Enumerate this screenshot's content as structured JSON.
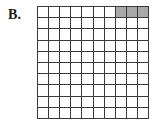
{
  "figure": {
    "label": "B.",
    "caption": "",
    "background_color": "#ffffff"
  },
  "grid": {
    "rows": 10,
    "columns": 10,
    "total_cells": 100,
    "shaded_count": 3,
    "unshaded_count": 97,
    "line_color": "#3a3a3a",
    "cell_fill_color": "#ffffff",
    "shaded_fill_color": "#a9a9a9",
    "shaded_cells": [
      {
        "row": 1,
        "column": 8
      },
      {
        "row": 1,
        "column": 9
      },
      {
        "row": 1,
        "column": 10
      }
    ]
  },
  "chart_data": {
    "type": "heatmap",
    "title": "B.",
    "xlabel": "",
    "ylabel": "",
    "categories": [
      "1",
      "2",
      "3",
      "4",
      "5",
      "6",
      "7",
      "8",
      "9",
      "10"
    ],
    "row_labels": [
      "1",
      "2",
      "3",
      "4",
      "5",
      "6",
      "7",
      "8",
      "9",
      "10"
    ],
    "grid": true,
    "legend": "none",
    "values": [
      [
        0,
        0,
        0,
        0,
        0,
        0,
        0,
        1,
        1,
        1
      ],
      [
        0,
        0,
        0,
        0,
        0,
        0,
        0,
        0,
        0,
        0
      ],
      [
        0,
        0,
        0,
        0,
        0,
        0,
        0,
        0,
        0,
        0
      ],
      [
        0,
        0,
        0,
        0,
        0,
        0,
        0,
        0,
        0,
        0
      ],
      [
        0,
        0,
        0,
        0,
        0,
        0,
        0,
        0,
        0,
        0
      ],
      [
        0,
        0,
        0,
        0,
        0,
        0,
        0,
        0,
        0,
        0
      ],
      [
        0,
        0,
        0,
        0,
        0,
        0,
        0,
        0,
        0,
        0
      ],
      [
        0,
        0,
        0,
        0,
        0,
        0,
        0,
        0,
        0,
        0
      ],
      [
        0,
        0,
        0,
        0,
        0,
        0,
        0,
        0,
        0,
        0
      ],
      [
        0,
        0,
        0,
        0,
        0,
        0,
        0,
        0,
        0,
        0
      ]
    ],
    "value_colors": {
      "0": "#ffffff",
      "1": "#a9a9a9"
    },
    "shaded_fraction": "3/100"
  }
}
